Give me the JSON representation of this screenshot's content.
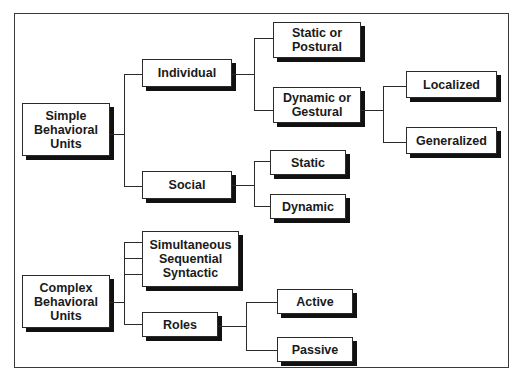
{
  "diagram": {
    "type": "hierarchy-tree",
    "nodes": {
      "simple_behavioral_units": "Simple\nBehavioral\nUnits",
      "individual": "Individual",
      "static_or_postural": "Static or\nPostural",
      "dynamic_or_gestural": "Dynamic or\nGestural",
      "localized": "Localized",
      "generalized": "Generalized",
      "social": "Social",
      "social_static": "Static",
      "social_dynamic": "Dynamic",
      "complex_behavioral_units": "Complex\nBehavioral\nUnits",
      "simultaneous_sequential_syntactic": "Simultaneous\nSequential\nSyntactic",
      "roles": "Roles",
      "active": "Active",
      "passive": "Passive"
    },
    "edges": [
      [
        "Simple Behavioral Units",
        "Individual"
      ],
      [
        "Simple Behavioral Units",
        "Social"
      ],
      [
        "Individual",
        "Static or Postural"
      ],
      [
        "Individual",
        "Dynamic or Gestural"
      ],
      [
        "Dynamic or Gestural",
        "Localized"
      ],
      [
        "Dynamic or Gestural",
        "Generalized"
      ],
      [
        "Social",
        "Static"
      ],
      [
        "Social",
        "Dynamic"
      ],
      [
        "Complex Behavioral Units",
        "Simultaneous"
      ],
      [
        "Complex Behavioral Units",
        "Sequential"
      ],
      [
        "Complex Behavioral Units",
        "Syntactic"
      ],
      [
        "Complex Behavioral Units",
        "Roles"
      ],
      [
        "Roles",
        "Active"
      ],
      [
        "Roles",
        "Passive"
      ]
    ],
    "colors": {
      "line": "#2a2a2a",
      "shadow": "#111111",
      "box_fill": "#ffffff",
      "text": "#1a1a1a"
    }
  }
}
